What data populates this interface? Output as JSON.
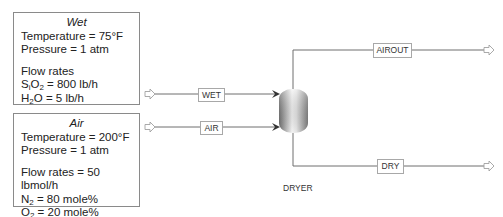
{
  "wet_box": {
    "title": "Wet",
    "temperature": "Temperature = 75°F",
    "pressure": "Pressure = 1 atm",
    "flow_label": "Flow rates",
    "sio2_prefix": "S",
    "sio2_sub1": "i",
    "sio2_mid": "O",
    "sio2_sub2": "2",
    "sio2_value": " = 800 lb/h",
    "h2o_prefix": "H",
    "h2o_sub": "2",
    "h2o_value": "O = 5 lb/h"
  },
  "air_box": {
    "title": "Air",
    "temperature": "Temperature = 200°F",
    "pressure": "Pressure = 1 atm",
    "flow_label": "Flow rates = 50 lbmol/h",
    "n2_prefix": "N",
    "n2_sub": "2",
    "n2_value": " = 80 mole%",
    "o2_prefix": "O",
    "o2_sub": "2",
    "o2_value": " = 20 mole%"
  },
  "streams": {
    "wet": "WET",
    "air": "AIR",
    "airout": "AIROUT",
    "dry": "DRY"
  },
  "unit": {
    "name": "DRYER"
  },
  "colors": {
    "line": "#6e6e6e",
    "box_border": "#8a8a8a",
    "vessel_dark": "#7a7a7a",
    "vessel_light": "#f2f2f2"
  }
}
